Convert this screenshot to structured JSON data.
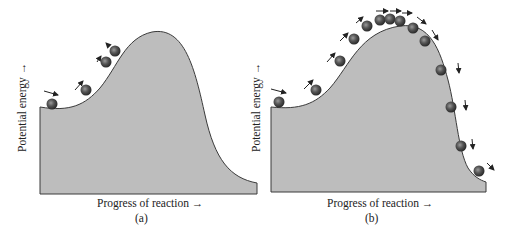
{
  "panels": [
    {
      "id": "a",
      "caption": "(a)",
      "x_axis_label": "Progress of reaction →",
      "y_axis_label": "Potential energy →",
      "description": "Molecules roll partway up the energy barrier but lack energy to reach the top",
      "ball_count": 4
    },
    {
      "id": "b",
      "caption": "(b)",
      "x_axis_label": "Progress of reaction →",
      "y_axis_label": "Potential energy →",
      "description": "Molecule has enough energy to go over the barrier and down the other side",
      "ball_count": 14
    }
  ],
  "colors": {
    "fill": "#bdbdbd",
    "outline": "#3a3a3a",
    "ball": "#4a4a4a",
    "arrow": "#222222"
  }
}
